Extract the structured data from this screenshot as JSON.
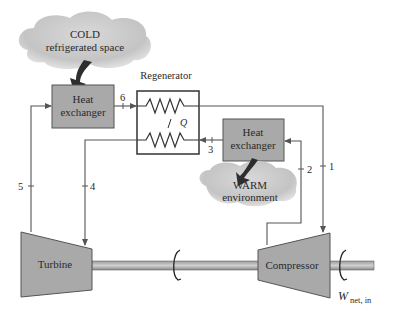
{
  "diagram": {
    "components": {
      "cold_space": {
        "line1": "COLD",
        "line2": "refrigerated space"
      },
      "cold_hx": {
        "line1": "Heat",
        "line2": "exchanger"
      },
      "regenerator": {
        "label": "Regenerator",
        "heat": "Q"
      },
      "warm_hx": {
        "line1": "Heat",
        "line2": "exchanger"
      },
      "warm_env": {
        "line1": "WARM",
        "line2": "environment"
      },
      "turbine": {
        "label": "Turbine"
      },
      "compressor": {
        "label": "Compressor"
      },
      "work": {
        "symbol": "W",
        "subscript": "net, in"
      }
    },
    "states": {
      "s1": "1",
      "s2": "2",
      "s3": "3",
      "s4": "4",
      "s5": "5",
      "s6": "6"
    },
    "colors": {
      "box_fill": "#a9a9a9",
      "cloud_fill": "#c8c8c8",
      "line": "#555555",
      "arrow": "#3a3a3a",
      "shaft": "#b5b5b5"
    }
  }
}
